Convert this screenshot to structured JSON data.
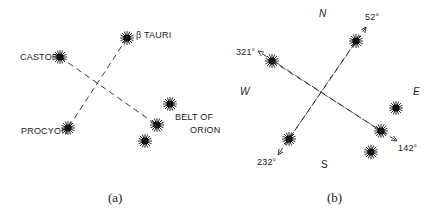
{
  "panel_a": {
    "caption": "(a)",
    "labels": {
      "castor": "CASTOR",
      "beta_tauri": "β TAURI",
      "procyon": "PROCYON",
      "belt_line1": "BELT OF",
      "belt_line2": "ORION"
    }
  },
  "panel_b": {
    "caption": "(b)",
    "compass": {
      "north": "N",
      "south": "S",
      "east": "E",
      "west": "W"
    },
    "bearings": {
      "ne": "52°",
      "nw": "321°",
      "sw": "232°",
      "se": "142°"
    }
  },
  "colors": {
    "ink": "#1a1a1a",
    "background": "#ffffff"
  }
}
